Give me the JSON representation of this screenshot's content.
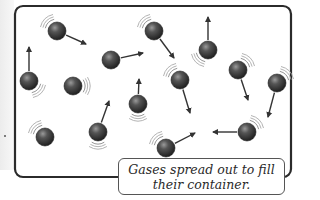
{
  "diagram": {
    "caption": "Gases spread out to fill their container.",
    "colors": {
      "container_border": "#2b2b2b",
      "particle": "#3a3a3a",
      "arrow": "#333333"
    },
    "container": {
      "x": 14,
      "y": 5,
      "width": 278,
      "height": 173,
      "radius": 8
    },
    "particles": [
      {
        "id": 1,
        "cx": 57,
        "cy": 31,
        "arrow_to": [
          86,
          44
        ],
        "vib": "ul"
      },
      {
        "id": 2,
        "cx": 29,
        "cy": 81,
        "arrow_to": [
          29,
          47
        ],
        "vib": "br"
      },
      {
        "id": 3,
        "cx": 73,
        "cy": 86,
        "arrow_to": null,
        "vib": "r"
      },
      {
        "id": 4,
        "cx": 111,
        "cy": 60,
        "arrow_to": [
          143,
          53
        ],
        "vib": null
      },
      {
        "id": 5,
        "cx": 154,
        "cy": 31,
        "arrow_to": [
          174,
          58
        ],
        "vib": "ul"
      },
      {
        "id": 6,
        "cx": 208,
        "cy": 50,
        "arrow_to": [
          208,
          17
        ],
        "vib": "bl"
      },
      {
        "id": 7,
        "cx": 238,
        "cy": 70,
        "arrow_to": [
          248,
          100
        ],
        "vib": "ur"
      },
      {
        "id": 8,
        "cx": 277,
        "cy": 83,
        "arrow_to": [
          268,
          117
        ],
        "vib": "ur"
      },
      {
        "id": 9,
        "cx": 180,
        "cy": 80,
        "arrow_to": [
          190,
          113
        ],
        "vib": "ul"
      },
      {
        "id": 10,
        "cx": 138,
        "cy": 104,
        "arrow_to": [
          139,
          79
        ],
        "vib": "b"
      },
      {
        "id": 11,
        "cx": 98,
        "cy": 132,
        "arrow_to": [
          109,
          101
        ],
        "vib": "b"
      },
      {
        "id": 12,
        "cx": 45,
        "cy": 137,
        "arrow_to": null,
        "vib": "ul"
      },
      {
        "id": 13,
        "cx": 166,
        "cy": 148,
        "arrow_to": [
          195,
          133
        ],
        "vib": "ul"
      },
      {
        "id": 14,
        "cx": 247,
        "cy": 132,
        "arrow_to": [
          213,
          132
        ],
        "vib": "ur"
      }
    ]
  }
}
